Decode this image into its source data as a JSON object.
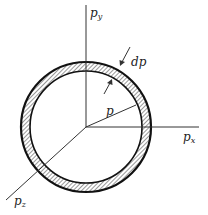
{
  "diagram": {
    "axes": {
      "y": {
        "base": "p",
        "sub": "y"
      },
      "x": {
        "base": "p",
        "sub": "x"
      },
      "z": {
        "base": "p",
        "sub": "z"
      }
    },
    "labels": {
      "radius": "p",
      "thickness": "dp"
    },
    "colors": {
      "ink": "#222222",
      "background": "#ffffff"
    }
  }
}
